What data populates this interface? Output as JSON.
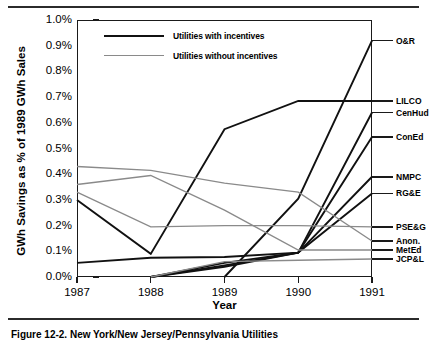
{
  "figure": {
    "caption": "Figure 12-2.  New York/New Jersey/Pennsylvania Utilities"
  },
  "legend": {
    "items": [
      {
        "label": "Utilities with incentives",
        "style": "thick-black"
      },
      {
        "label": "Utilities without incentives",
        "style": "thin-gray"
      }
    ]
  },
  "colors": {
    "with_incentives": "#111111",
    "without_incentives": "#8a8a8a",
    "axis": "#1a1a1a",
    "background": "#ffffff"
  },
  "chart_data": {
    "type": "line",
    "title": "",
    "xlabel": "Year",
    "ylabel": "GWh Savings as % of 1989 GWh Sales",
    "x": [
      1987,
      1988,
      1989,
      1990,
      1991
    ],
    "xtick_labels": [
      "1987",
      "1988",
      "1989",
      "1990",
      "1991"
    ],
    "ytick_labels": [
      "0.0%",
      "0.1%",
      "0.2%",
      "0.3%",
      "0.4%",
      "0.5%",
      "0.6%",
      "0.7%",
      "0.8%",
      "0.9%",
      "1.0%"
    ],
    "ytick_values": [
      0.0,
      0.1,
      0.2,
      0.3,
      0.4,
      0.5,
      0.6,
      0.7,
      0.8,
      0.9,
      1.0
    ],
    "ylim": [
      0.0,
      1.0
    ],
    "xlim": [
      1987,
      1991
    ],
    "grid": false,
    "legend_position": "upper-left-inside",
    "value_unit": "percent",
    "series": [
      {
        "name": "O&R",
        "group": "with incentives",
        "values": [
          null,
          null,
          0.0,
          0.305,
          0.92
        ],
        "label_y": 0.92
      },
      {
        "name": "LILCO",
        "group": "with incentives",
        "values": [
          0.3,
          0.09,
          0.575,
          0.685,
          0.685
        ],
        "label_y": 0.685
      },
      {
        "name": "CenHud",
        "group": "with incentives",
        "values": [
          null,
          0.0,
          0.045,
          0.095,
          0.64
        ],
        "label_y": 0.64
      },
      {
        "name": "ConEd",
        "group": "with incentives",
        "values": [
          null,
          0.0,
          0.04,
          0.095,
          0.545
        ],
        "label_y": 0.545
      },
      {
        "name": "NMPC",
        "group": "with incentives",
        "values": [
          null,
          0.0,
          0.055,
          0.095,
          0.39
        ],
        "label_y": 0.39
      },
      {
        "name": "RG&E",
        "group": "with incentives",
        "values": [
          0.055,
          0.075,
          0.078,
          0.095,
          0.325
        ],
        "label_y": 0.325
      },
      {
        "name": "PSE&G",
        "group": "without incentives",
        "values": [
          0.33,
          0.195,
          0.2,
          0.2,
          0.195
        ],
        "label_y": 0.195
      },
      {
        "name": "Anon.",
        "group": "without incentives",
        "values": [
          0.43,
          0.415,
          0.365,
          0.33,
          0.14
        ],
        "label_y": 0.14
      },
      {
        "name": "MetEd",
        "group": "without incentives",
        "values": [
          0.36,
          0.395,
          0.26,
          0.105,
          0.105
        ],
        "label_y": 0.105
      },
      {
        "name": "JCP&L",
        "group": "without incentives",
        "values": [
          null,
          0.0,
          0.06,
          0.065,
          0.07
        ],
        "label_y": 0.07
      }
    ]
  }
}
